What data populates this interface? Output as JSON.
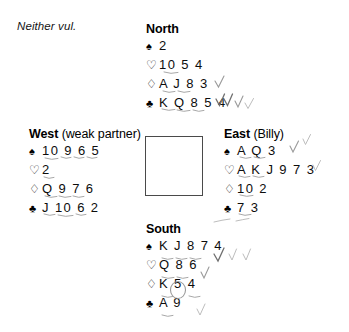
{
  "deal": {
    "vulnerability": "Neither vul.",
    "suit_symbols": {
      "spade": "♠",
      "heart": "♡",
      "diamond": "♢",
      "club": "♣"
    },
    "hands": {
      "north": {
        "label": "North",
        "qualifier": "",
        "spades": "2",
        "hearts": "10 5 4",
        "diamonds": "A J 8 3",
        "clubs": "K Q 8 5 4"
      },
      "west": {
        "label": "West",
        "qualifier": "(weak partner)",
        "spades": "10 9 6 5",
        "hearts": "2",
        "diamonds": "Q 9 7 6",
        "clubs": "J 10 6 2"
      },
      "east": {
        "label": "East",
        "qualifier": "(Billy)",
        "spades": "A Q 3",
        "hearts": "A K J 9 7 3",
        "diamonds": "10 2",
        "clubs": "7 3"
      },
      "south": {
        "label": "South",
        "qualifier": "",
        "spades": "K J 8 7 4",
        "hearts": "Q 8 6",
        "diamonds": "K 5 4",
        "clubs": "A 9"
      }
    }
  }
}
